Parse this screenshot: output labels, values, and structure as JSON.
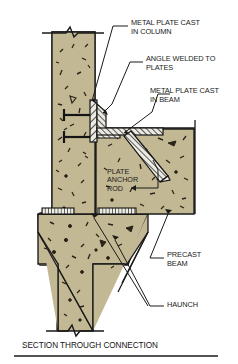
{
  "drawing": {
    "caption": "SECTION THROUGH CONNECTION",
    "colors": {
      "concrete_fill": "#c3b894",
      "steel_fill": "#e8e6df",
      "line": "#1a1a1a",
      "background": "#ffffff"
    },
    "annotations": [
      {
        "id": "metal-plate-cast-in-column",
        "line1": "METAL PLATE CAST",
        "line2": "IN COLUMN"
      },
      {
        "id": "angle-welded-to-plates",
        "line1": "ANGLE WELDED TO",
        "line2": "PLATES"
      },
      {
        "id": "metal-plate-cast-in-beam",
        "line1": "METAL PLATE CAST",
        "line2": "IN BEAM"
      },
      {
        "id": "precast-beam",
        "line1": "PRECAST",
        "line2": "BEAM"
      },
      {
        "id": "haunch",
        "line1": "HAUNCH",
        "line2": ""
      }
    ],
    "inner_labels": [
      {
        "id": "plate-anchor-rod",
        "line1": "PLATE",
        "line2": "ANCHOR",
        "line3": "ROD"
      }
    ],
    "components": [
      {
        "name": "precast-column",
        "material": "concrete"
      },
      {
        "name": "precast-beam",
        "material": "concrete"
      },
      {
        "name": "haunch",
        "material": "concrete"
      },
      {
        "name": "column-embed-plate",
        "material": "steel"
      },
      {
        "name": "beam-embed-plate",
        "material": "steel"
      },
      {
        "name": "connection-angle",
        "material": "steel"
      },
      {
        "name": "plate-anchor-rod",
        "material": "steel"
      },
      {
        "name": "column-anchor-studs",
        "material": "steel"
      }
    ]
  }
}
